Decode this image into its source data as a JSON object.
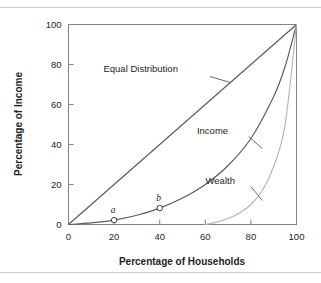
{
  "figure": {
    "background_color": "#ffffff",
    "rule_color": "#c9ccce",
    "has_top_rule": true,
    "has_bottom_rule": true
  },
  "chart_data": {
    "type": "line",
    "title": "",
    "xlabel": "Percentage of Households",
    "ylabel": "Percentage of Income",
    "xlim": [
      0,
      100
    ],
    "ylim": [
      0,
      100
    ],
    "xticks": [
      0,
      20,
      40,
      60,
      80,
      100
    ],
    "yticks": [
      0,
      20,
      40,
      60,
      80,
      100
    ],
    "xtick_labels": [
      "0",
      "20",
      "40",
      "60",
      "80",
      "100"
    ],
    "ytick_labels": [
      "0",
      "20",
      "40",
      "60",
      "80",
      "100"
    ],
    "grid": false,
    "legend_position": "inline-annotations",
    "tick_direction": "in",
    "series": [
      {
        "name": "Equal Distribution",
        "label": "Equal Distribution",
        "color": "#595a5c",
        "x": [
          0,
          20,
          40,
          60,
          80,
          100
        ],
        "values": [
          0,
          20,
          40,
          60,
          80,
          100
        ],
        "label_x": 48,
        "label_y": 78,
        "leader_from_x": 62,
        "leader_from_y": 74,
        "leader_to_x": 71,
        "leader_to_y": 71
      },
      {
        "name": "Income",
        "label": "Income",
        "color": "#595a5c",
        "x": [
          0,
          10,
          20,
          30,
          40,
          50,
          60,
          70,
          80,
          90,
          95,
          100
        ],
        "values": [
          0,
          0.8,
          2.2,
          4.6,
          8.2,
          13.2,
          20.0,
          29.5,
          43.0,
          64.0,
          79.0,
          100
        ],
        "label_x": 70,
        "label_y": 47,
        "leader_from_x": 79,
        "leader_from_y": 44,
        "leader_to_x": 85,
        "leader_to_y": 38,
        "points": [
          {
            "id": "a",
            "label": "a",
            "x": 20,
            "y": 2.2,
            "label_dx": -1,
            "label_dy": 7
          },
          {
            "id": "b",
            "label": "b",
            "x": 40,
            "y": 8.2,
            "label_dx": -1,
            "label_dy": 7
          }
        ]
      },
      {
        "name": "Wealth",
        "label": "Wealth",
        "color": "#b3b5b7",
        "x": [
          60,
          65,
          70,
          75,
          80,
          85,
          90,
          95,
          100
        ],
        "values": [
          0,
          1.2,
          3.0,
          5.8,
          10.0,
          17.0,
          29.0,
          50.0,
          100
        ],
        "label_x": 73,
        "label_y": 22,
        "leader_from_x": 80,
        "leader_from_y": 19,
        "leader_to_x": 85,
        "leader_to_y": 12
      }
    ]
  },
  "axes": {
    "frame_color": "#808285",
    "axis_color": "#808285",
    "x_axis_title": "Percentage of Households",
    "y_axis_title": "Percentage of Income"
  }
}
